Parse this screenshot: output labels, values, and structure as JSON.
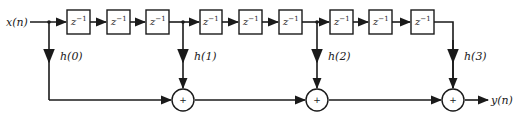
{
  "diagram": {
    "type": "FIR filter structure (sparse tapped delay line)",
    "input_label": "x(n)",
    "output_label": "y(n)",
    "delay_label": "z",
    "delay_exponent": "−1",
    "delay_count": 9,
    "taps": [
      {
        "label": "h(0)"
      },
      {
        "label": "h(1)"
      },
      {
        "label": "h(2)"
      },
      {
        "label": "h(3)"
      }
    ],
    "adders": [
      {
        "symbol": "+"
      },
      {
        "symbol": "+"
      },
      {
        "symbol": "+"
      }
    ],
    "colors": {
      "stroke": "#1a1a1a",
      "background": "#ffffff"
    }
  }
}
